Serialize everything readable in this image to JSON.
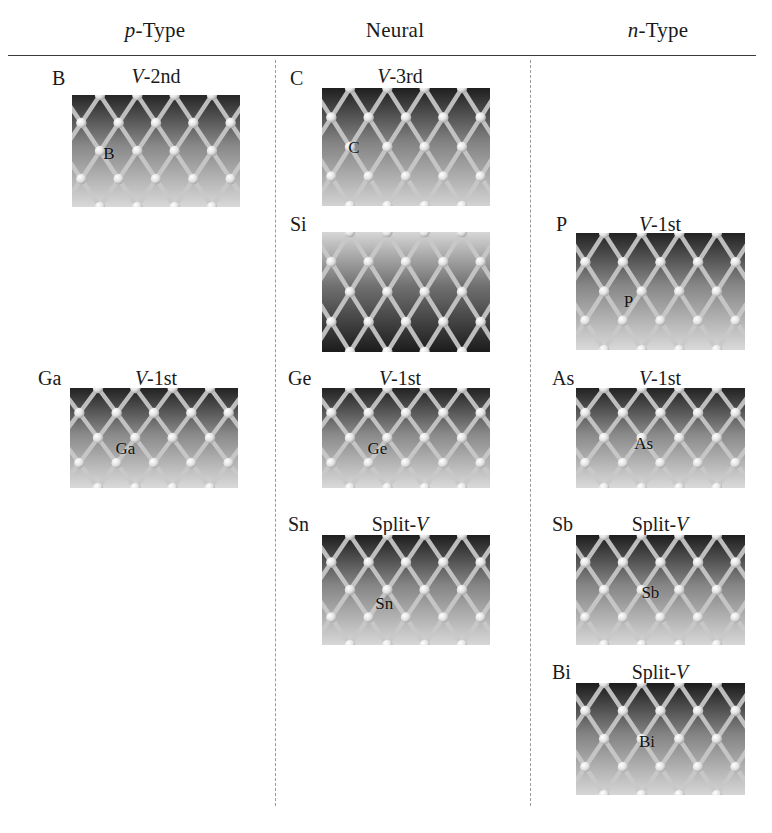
{
  "figure": {
    "columns": [
      {
        "id": "p-type",
        "label_italic": "p",
        "label_rest": "-Type",
        "center_x": 155
      },
      {
        "id": "neutral",
        "label_italic": "",
        "label_rest": "Neural",
        "center_x": 395
      },
      {
        "id": "n-type",
        "label_italic": "n",
        "label_rest": "-Type",
        "center_x": 658
      }
    ],
    "panels": [
      {
        "id": "B",
        "column": "p-type",
        "symbol": "B",
        "vacancy_prefix": "V",
        "vacancy_suffix": "-2nd",
        "dopant_label": "B",
        "sym_x": 52,
        "sym_y": 68,
        "title_cx": 156,
        "title_y": 66,
        "img_x": 72,
        "img_y": 95,
        "img_w": 168,
        "img_h": 112,
        "dop_x": 0.22,
        "dop_y": 0.52,
        "shade_top": "#262626",
        "shade_bottom": "#d8d8d8",
        "inverted": false
      },
      {
        "id": "C",
        "column": "neutral",
        "symbol": "C",
        "vacancy_prefix": "V",
        "vacancy_suffix": "-3rd",
        "dopant_label": "C",
        "sym_x": 290,
        "sym_y": 68,
        "title_cx": 400,
        "title_y": 66,
        "img_x": 322,
        "img_y": 88,
        "img_w": 168,
        "img_h": 118,
        "dop_x": 0.19,
        "dop_y": 0.5,
        "shade_top": "#1f1f1f",
        "shade_bottom": "#d2d2d2",
        "inverted": false
      },
      {
        "id": "Si",
        "column": "neutral",
        "symbol": "Si",
        "vacancy_prefix": "",
        "vacancy_suffix": "",
        "dopant_label": "",
        "sym_x": 290,
        "sym_y": 214,
        "title_cx": 400,
        "title_y": 214,
        "img_x": 322,
        "img_y": 232,
        "img_w": 168,
        "img_h": 120,
        "dop_x": 0.5,
        "dop_y": 0.5,
        "shade_top": "#d6d6d6",
        "shade_bottom": "#1c1c1c",
        "inverted": true
      },
      {
        "id": "P",
        "column": "n-type",
        "symbol": "P",
        "vacancy_prefix": "V",
        "vacancy_suffix": "-1st",
        "dopant_label": "P",
        "sym_x": 556,
        "sym_y": 214,
        "title_cx": 660,
        "title_y": 214,
        "img_x": 576,
        "img_y": 233,
        "img_w": 169,
        "img_h": 117,
        "dop_x": 0.31,
        "dop_y": 0.58,
        "shade_top": "#232323",
        "shade_bottom": "#d9d9d9",
        "inverted": false
      },
      {
        "id": "Ga",
        "column": "p-type",
        "symbol": "Ga",
        "vacancy_prefix": "V",
        "vacancy_suffix": "-1st",
        "dopant_label": "Ga",
        "sym_x": 38,
        "sym_y": 368,
        "title_cx": 156,
        "title_y": 368,
        "img_x": 70,
        "img_y": 388,
        "img_w": 168,
        "img_h": 100,
        "dop_x": 0.33,
        "dop_y": 0.6,
        "shade_top": "#222222",
        "shade_bottom": "#dadada",
        "inverted": false
      },
      {
        "id": "Ge",
        "column": "neutral",
        "symbol": "Ge",
        "vacancy_prefix": "V",
        "vacancy_suffix": "-1st",
        "dopant_label": "Ge",
        "sym_x": 288,
        "sym_y": 368,
        "title_cx": 400,
        "title_y": 368,
        "img_x": 322,
        "img_y": 388,
        "img_w": 168,
        "img_h": 100,
        "dop_x": 0.33,
        "dop_y": 0.6,
        "shade_top": "#222222",
        "shade_bottom": "#dadada",
        "inverted": false
      },
      {
        "id": "As",
        "column": "n-type",
        "symbol": "As",
        "vacancy_prefix": "V",
        "vacancy_suffix": "-1st",
        "dopant_label": "As",
        "sym_x": 552,
        "sym_y": 368,
        "title_cx": 660,
        "title_y": 368,
        "img_x": 576,
        "img_y": 388,
        "img_w": 169,
        "img_h": 100,
        "dop_x": 0.4,
        "dop_y": 0.55,
        "shade_top": "#222222",
        "shade_bottom": "#dadada",
        "inverted": false
      },
      {
        "id": "Sn",
        "column": "neutral",
        "symbol": "Sn",
        "vacancy_prefix": "Split-",
        "vacancy_suffix": "",
        "dopant_label": "Sn",
        "sym_x": 288,
        "sym_y": 514,
        "title_cx": 400,
        "title_y": 514,
        "img_x": 322,
        "img_y": 535,
        "img_w": 168,
        "img_h": 110,
        "dop_x": 0.37,
        "dop_y": 0.62,
        "shade_top": "#1e1e1e",
        "shade_bottom": "#d7d7d7",
        "inverted": false
      },
      {
        "id": "Sb",
        "column": "n-type",
        "symbol": "Sb",
        "vacancy_prefix": "Split-",
        "vacancy_suffix": "",
        "dopant_label": "Sb",
        "sym_x": 552,
        "sym_y": 514,
        "title_cx": 660,
        "title_y": 514,
        "img_x": 576,
        "img_y": 535,
        "img_w": 169,
        "img_h": 110,
        "dop_x": 0.44,
        "dop_y": 0.52,
        "shade_top": "#1e1e1e",
        "shade_bottom": "#d7d7d7",
        "inverted": false
      },
      {
        "id": "Bi",
        "column": "n-type",
        "symbol": "Bi",
        "vacancy_prefix": "Split-",
        "vacancy_suffix": "",
        "dopant_label": "Bi",
        "sym_x": 552,
        "sym_y": 662,
        "title_cx": 660,
        "title_y": 662,
        "img_x": 576,
        "img_y": 683,
        "img_w": 169,
        "img_h": 112,
        "dop_x": 0.42,
        "dop_y": 0.52,
        "shade_top": "#1c1c1c",
        "shade_bottom": "#d6d6d6",
        "inverted": false
      }
    ],
    "dividers": [
      {
        "id": "divider-left",
        "x": 275,
        "y": 60,
        "height": 746
      },
      {
        "id": "divider-right",
        "x": 530,
        "y": 60,
        "height": 746
      }
    ],
    "vacancy_italic_glyph": "V",
    "colors": {
      "rule": "#3a3a3a",
      "divider": "#9a9a9a",
      "text": "#1a1a1a",
      "atom": "#efefef",
      "bond": "#c9c9c9",
      "background": "#ffffff"
    }
  }
}
